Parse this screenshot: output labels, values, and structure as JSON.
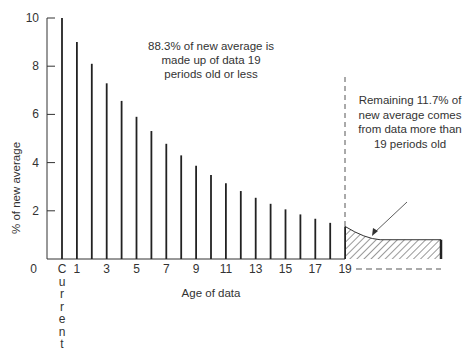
{
  "chart_data": {
    "type": "bar",
    "title": "",
    "xlabel": "Age of data",
    "ylabel": "% of new average",
    "ylim": [
      0,
      10
    ],
    "yticks": [
      "0",
      "2",
      "4",
      "6",
      "8",
      "10"
    ],
    "xtick_labels": [
      "Current",
      "1",
      "3",
      "5",
      "7",
      "9",
      "11",
      "13",
      "15",
      "17",
      "19"
    ],
    "categories": [
      "Current",
      "1",
      "2",
      "3",
      "4",
      "5",
      "6",
      "7",
      "8",
      "9",
      "10",
      "11",
      "12",
      "13",
      "14",
      "15",
      "16",
      "17",
      "18",
      "19"
    ],
    "values": [
      10,
      9.0,
      8.1,
      7.29,
      6.56,
      5.9,
      5.31,
      4.78,
      4.3,
      3.87,
      3.49,
      3.14,
      2.82,
      2.54,
      2.29,
      2.06,
      1.85,
      1.67,
      1.5,
      1.35
    ],
    "tail_region": {
      "from": 19,
      "start_value": 1.35,
      "end_value": 0.8,
      "style": "hatched"
    },
    "annotations": [
      {
        "lines": [
          "88.3% of new average is",
          "made up of data 19",
          "periods old or less"
        ]
      },
      {
        "lines": [
          "Remaining 11.7% of",
          "new average comes",
          "from data more than",
          "19 periods old"
        ]
      }
    ],
    "grid": false,
    "legend": null
  }
}
